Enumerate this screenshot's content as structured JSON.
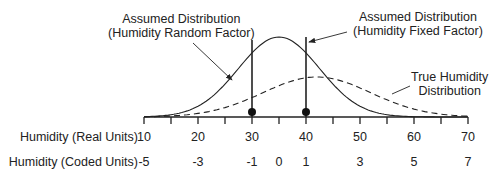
{
  "annotations": {
    "random_factor": [
      "Assumed Distribution",
      "(Humidity Random Factor)"
    ],
    "fixed_factor": [
      "Assumed Distribution",
      "(Humidity Fixed Factor)"
    ],
    "true_distribution": [
      "True Humidity",
      "Distribution"
    ]
  },
  "axes": {
    "real_label": "Humidity (Real Units)",
    "coded_label": "Humidity (Coded Units)",
    "real_ticks": [
      "10",
      "20",
      "30",
      "40",
      "50",
      "60",
      "70"
    ],
    "real_tick_values": [
      10,
      20,
      30,
      40,
      50,
      60,
      70
    ],
    "coded_ticks": [
      "-5",
      "-3",
      "-1",
      "0",
      "1",
      "3",
      "5",
      "7"
    ],
    "coded_tick_values": [
      10,
      20,
      30,
      35,
      40,
      50,
      60,
      70
    ],
    "range": [
      10,
      70
    ],
    "minor_step": 5
  },
  "chart_data": {
    "type": "line",
    "xlabel": "Humidity (Real Units)",
    "xlim": [
      10,
      70
    ],
    "series": [
      {
        "name": "Assumed Distribution",
        "style": "solid",
        "mean": 35,
        "sd": 7.5,
        "relative_peak": 1.0
      },
      {
        "name": "True Humidity Distribution",
        "style": "dashed",
        "mean": 42,
        "sd": 10,
        "relative_peak": 0.5
      }
    ],
    "markers": [
      {
        "name": "Humidity Random Factor level",
        "x": 30
      },
      {
        "name": "Humidity Fixed Factor level",
        "x": 40
      }
    ]
  }
}
